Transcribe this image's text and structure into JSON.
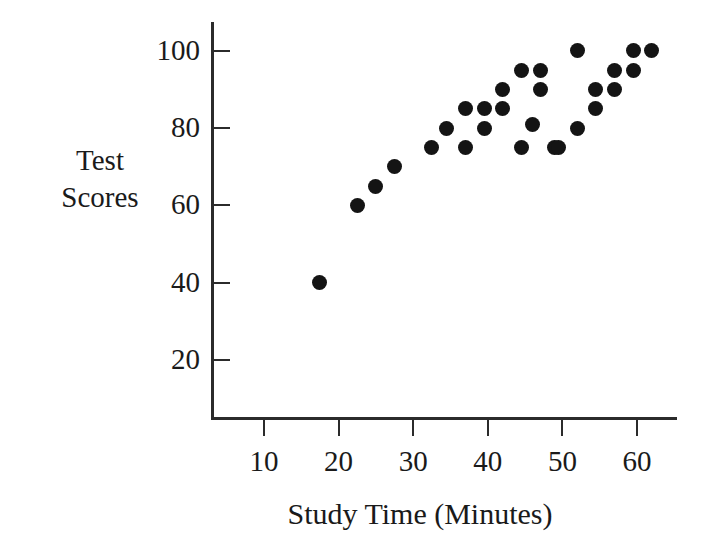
{
  "chart_data": {
    "type": "scatter",
    "title": "",
    "xlabel": "Study Time (Minutes)",
    "ylabel_lines": [
      "Test",
      "Scores"
    ],
    "ylabel": "Test Scores",
    "xlim": [
      0,
      65
    ],
    "ylim": [
      0,
      110
    ],
    "xticks": [
      10,
      20,
      30,
      40,
      50,
      60
    ],
    "yticks": [
      20,
      40,
      60,
      80,
      100
    ],
    "xtick_labels": [
      "10",
      "20",
      "30",
      "40",
      "50",
      "60"
    ],
    "ytick_labels": [
      "20",
      "40",
      "60",
      "80",
      "100"
    ],
    "grid": false,
    "legend": null,
    "marker": {
      "shape": "circle",
      "color": "#141414",
      "size_px": 15
    },
    "axis_color": "#2b2b2b",
    "background_color": "#ffffff",
    "n_points": 28,
    "points": [
      {
        "x": 17.5,
        "y": 40
      },
      {
        "x": 22.5,
        "y": 60
      },
      {
        "x": 25.0,
        "y": 65
      },
      {
        "x": 27.5,
        "y": 70
      },
      {
        "x": 32.5,
        "y": 75
      },
      {
        "x": 34.5,
        "y": 80
      },
      {
        "x": 37.0,
        "y": 75
      },
      {
        "x": 37.0,
        "y": 85
      },
      {
        "x": 39.5,
        "y": 80
      },
      {
        "x": 39.5,
        "y": 85
      },
      {
        "x": 42.0,
        "y": 85
      },
      {
        "x": 42.0,
        "y": 90
      },
      {
        "x": 44.5,
        "y": 75
      },
      {
        "x": 44.5,
        "y": 95
      },
      {
        "x": 46.0,
        "y": 81
      },
      {
        "x": 47.0,
        "y": 90
      },
      {
        "x": 47.0,
        "y": 95
      },
      {
        "x": 49.0,
        "y": 75
      },
      {
        "x": 52.0,
        "y": 80
      },
      {
        "x": 52.0,
        "y": 100
      },
      {
        "x": 54.5,
        "y": 85
      },
      {
        "x": 54.5,
        "y": 90
      },
      {
        "x": 57.0,
        "y": 90
      },
      {
        "x": 57.0,
        "y": 95
      },
      {
        "x": 59.5,
        "y": 95
      },
      {
        "x": 59.5,
        "y": 100
      },
      {
        "x": 62.0,
        "y": 100
      },
      {
        "x": 49.5,
        "y": 75
      }
    ]
  }
}
